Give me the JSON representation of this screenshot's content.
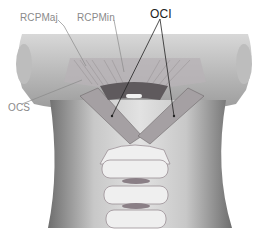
{
  "figure": {
    "labels": [
      {
        "id": "rcpmaj",
        "text": "RCPMaj",
        "x": 20,
        "y": 12
      },
      {
        "id": "rcpmin",
        "text": "RCPMin",
        "x": 77,
        "y": 12
      },
      {
        "id": "oci",
        "text": "OCI",
        "x": 155,
        "y": 8
      },
      {
        "id": "ocs",
        "text": "OCS",
        "x": 8,
        "y": 104
      }
    ],
    "colors": {
      "background": "#ffffff",
      "skin_light": "#e6e6e6",
      "skin_mid": "#bdbdbd",
      "skin_dark": "#7a7a7a",
      "bone": "#f2f2f2",
      "bone_shadow": "#9a8f95",
      "muscle": "#a8a3a6",
      "label_gray": "#8a8a8a",
      "label_dark": "#222222"
    }
  }
}
